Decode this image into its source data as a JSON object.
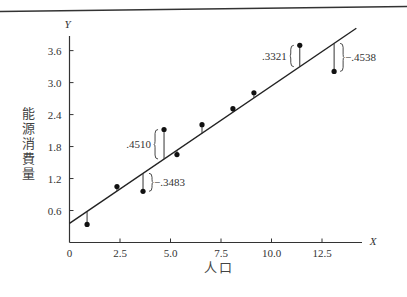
{
  "chart_data": {
    "type": "scatter",
    "title": "",
    "xlabel": "人口",
    "ylabel": "能源消費量",
    "x_axis_var": "X",
    "y_axis_var": "Y",
    "xlim": [
      0,
      14.5
    ],
    "ylim": [
      0,
      3.9
    ],
    "x_ticks": [
      0,
      2.5,
      5.0,
      7.5,
      10.0,
      12.5
    ],
    "x_tick_labels": [
      "0",
      "2.5",
      "5.0",
      "7.5",
      "10.0",
      "12.5"
    ],
    "y_ticks": [
      0.6,
      1.2,
      1.8,
      2.4,
      3.0,
      3.6
    ],
    "y_tick_labels": [
      "0.6",
      "1.2",
      "1.8",
      "2.4",
      "3.0",
      "3.6"
    ],
    "grid": false,
    "legend": null,
    "series": [
      {
        "name": "observations",
        "points": [
          {
            "x": 0.87,
            "y": 0.34
          },
          {
            "x": 2.35,
            "y": 1.05
          },
          {
            "x": 3.64,
            "y": 0.96
          },
          {
            "x": 4.68,
            "y": 2.12
          },
          {
            "x": 5.32,
            "y": 1.65
          },
          {
            "x": 6.56,
            "y": 2.21
          },
          {
            "x": 8.09,
            "y": 2.51
          },
          {
            "x": 9.13,
            "y": 2.81
          },
          {
            "x": 11.4,
            "y": 3.7
          },
          {
            "x": 13.1,
            "y": 3.21
          }
        ]
      }
    ],
    "regression_line": {
      "x0": 0,
      "y0": 0.36,
      "x1": 14.2,
      "y1": 4.02
    },
    "annotations": [
      {
        "text": ".4510",
        "point_index": 3,
        "side": "left"
      },
      {
        "text": "−.3483",
        "point_index": 2,
        "side": "right"
      },
      {
        "text": ".3321",
        "point_index": 8,
        "side": "left"
      },
      {
        "text": "−.4538",
        "point_index": 9,
        "side": "right"
      }
    ]
  },
  "labels": {
    "ylabel": "能源消費量",
    "xlabel": "人口",
    "x_var": "X",
    "y_var": "Y"
  }
}
